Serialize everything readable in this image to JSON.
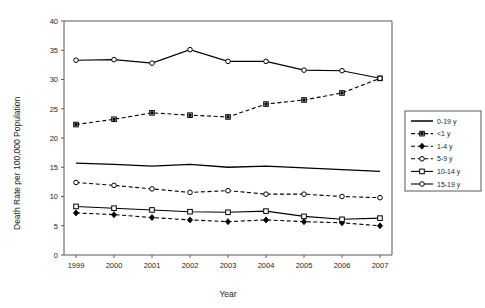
{
  "chart_data": {
    "type": "line",
    "title": "",
    "xlabel": "Year",
    "ylabel": "Death Rate per 100,000 Population",
    "categories": [
      "1999",
      "2000",
      "2001",
      "2002",
      "2003",
      "2004",
      "2005",
      "2006",
      "2007"
    ],
    "x": [
      1999,
      2000,
      2001,
      2002,
      2003,
      2004,
      2005,
      2006,
      2007
    ],
    "ylim": [
      0,
      40
    ],
    "yticks": [
      0,
      5,
      10,
      15,
      20,
      25,
      30,
      35,
      40
    ],
    "ytick_labels": [
      "0",
      "5",
      "10",
      "15",
      "20",
      "25",
      "30",
      "35",
      "40"
    ],
    "grid": false,
    "legend_position": "right-outside",
    "series": [
      {
        "name": "0-19 y",
        "values": [
          15.7,
          15.5,
          15.2,
          15.5,
          15.0,
          15.2,
          14.9,
          14.6,
          14.3
        ],
        "style": "solid",
        "marker": "none"
      },
      {
        "name": "<1 y",
        "values": [
          22.3,
          23.2,
          24.3,
          23.9,
          23.6,
          25.8,
          26.5,
          27.7,
          30.2
        ],
        "style": "dashed",
        "marker": "filled-square"
      },
      {
        "name": "1-4 y",
        "values": [
          7.2,
          6.9,
          6.4,
          6.0,
          5.7,
          6.0,
          5.7,
          5.5,
          5.0
        ],
        "style": "dashed",
        "marker": "filled-diamond"
      },
      {
        "name": "5-9 y",
        "values": [
          12.4,
          11.9,
          11.3,
          10.7,
          11.0,
          10.4,
          10.4,
          10.0,
          9.8
        ],
        "style": "dashed",
        "marker": "open-circle"
      },
      {
        "name": "10-14 y",
        "values": [
          8.3,
          8.0,
          7.7,
          7.4,
          7.3,
          7.5,
          6.6,
          6.1,
          6.3
        ],
        "style": "solid",
        "marker": "open-square"
      },
      {
        "name": "15-19 y",
        "values": [
          33.3,
          33.4,
          32.8,
          35.1,
          33.1,
          33.1,
          31.6,
          31.5,
          30.2
        ],
        "style": "solid",
        "marker": "open-circle"
      }
    ],
    "legend_entries": [
      "0-19 y",
      "<1 y",
      "1-4 y",
      "5-9 y",
      "10-14 y",
      "15-19 y"
    ],
    "colors": {
      "series": "#000000",
      "axis": "#58595b",
      "text": "#231f20",
      "background": "#ffffff"
    }
  }
}
